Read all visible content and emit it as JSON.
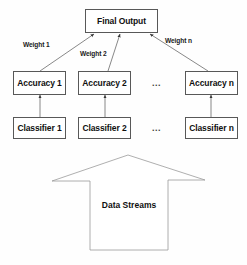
{
  "diagram": {
    "title_node": {
      "label": "Final Output"
    },
    "weights": [
      {
        "label": "Weight 1"
      },
      {
        "label": "Weight 2"
      },
      {
        "label": "Weight n"
      }
    ],
    "accuracy_nodes": [
      {
        "label": "Accuracy 1"
      },
      {
        "label": "Accuracy 2"
      },
      {
        "label": "Accuracy n"
      }
    ],
    "classifier_nodes": [
      {
        "label": "Classifier 1"
      },
      {
        "label": "Classifier 2"
      },
      {
        "label": "Classifier n"
      }
    ],
    "ellipsis": {
      "accuracy_row": "...",
      "classifier_row": "..."
    },
    "source_arrow": {
      "label": "Data Streams"
    },
    "colors": {
      "line": "#585858",
      "box_fill": "#ffffff",
      "text": "#101010",
      "background": "#fefefe"
    }
  }
}
